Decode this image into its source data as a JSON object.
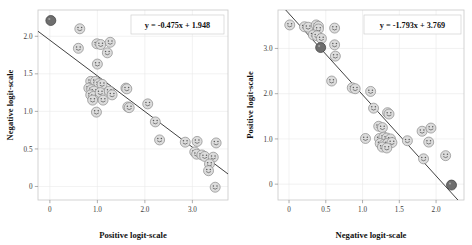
{
  "figure": {
    "background": "#ffffff",
    "panel_count": 2
  },
  "chart_data": [
    {
      "type": "scatter",
      "panel": "left",
      "title": "",
      "xlabel": "Positive logit-scale",
      "ylabel": "Negative logit-scale",
      "annotation": "y = -0.475x + 1.948",
      "fit": {
        "slope": -0.475,
        "intercept": 1.948
      },
      "xlim": [
        -0.25,
        3.75
      ],
      "ylim": [
        -0.18,
        2.35
      ],
      "xticks": [
        0,
        1.0,
        2.0,
        3.0
      ],
      "xtick_labels": [
        "0",
        "1.0",
        "2.0",
        "3.0"
      ],
      "yticks": [
        0,
        0.5,
        1.0,
        1.5,
        2.0
      ],
      "ytick_labels": [
        "0",
        "0.5",
        "1.0",
        "1.5",
        "2.0"
      ],
      "grid": true,
      "legend": "none",
      "marker": "emoji-face",
      "points": [
        {
          "x": 0.02,
          "y": 2.21,
          "dark": true
        },
        {
          "x": 0.63,
          "y": 2.1,
          "dark": false
        },
        {
          "x": 0.6,
          "y": 1.84,
          "dark": false
        },
        {
          "x": 0.99,
          "y": 1.9,
          "dark": false
        },
        {
          "x": 1.07,
          "y": 1.89,
          "dark": false
        },
        {
          "x": 1.27,
          "y": 1.92,
          "dark": false
        },
        {
          "x": 1.21,
          "y": 1.78,
          "dark": false
        },
        {
          "x": 1.0,
          "y": 1.63,
          "dark": false
        },
        {
          "x": 0.86,
          "y": 1.4,
          "dark": false
        },
        {
          "x": 0.96,
          "y": 1.4,
          "dark": false
        },
        {
          "x": 1.03,
          "y": 1.37,
          "dark": false
        },
        {
          "x": 1.1,
          "y": 1.36,
          "dark": false
        },
        {
          "x": 0.82,
          "y": 1.31,
          "dark": false
        },
        {
          "x": 0.88,
          "y": 1.29,
          "dark": false
        },
        {
          "x": 0.93,
          "y": 1.27,
          "dark": false
        },
        {
          "x": 0.86,
          "y": 1.22,
          "dark": false
        },
        {
          "x": 0.92,
          "y": 1.2,
          "dark": false
        },
        {
          "x": 1.06,
          "y": 1.25,
          "dark": false
        },
        {
          "x": 1.25,
          "y": 1.27,
          "dark": false
        },
        {
          "x": 1.31,
          "y": 1.22,
          "dark": false
        },
        {
          "x": 1.6,
          "y": 1.31,
          "dark": false
        },
        {
          "x": 1.62,
          "y": 1.3,
          "dark": false
        },
        {
          "x": 0.9,
          "y": 1.15,
          "dark": false
        },
        {
          "x": 1.12,
          "y": 1.15,
          "dark": false
        },
        {
          "x": 1.64,
          "y": 1.06,
          "dark": false
        },
        {
          "x": 2.06,
          "y": 1.1,
          "dark": false
        },
        {
          "x": 0.98,
          "y": 0.99,
          "dark": false
        },
        {
          "x": 1.67,
          "y": 1.05,
          "dark": false
        },
        {
          "x": 2.22,
          "y": 0.86,
          "dark": false
        },
        {
          "x": 2.31,
          "y": 0.62,
          "dark": false
        },
        {
          "x": 2.85,
          "y": 0.59,
          "dark": false
        },
        {
          "x": 3.1,
          "y": 0.6,
          "dark": false
        },
        {
          "x": 3.5,
          "y": 0.58,
          "dark": false
        },
        {
          "x": 3.05,
          "y": 0.46,
          "dark": false
        },
        {
          "x": 3.09,
          "y": 0.43,
          "dark": false
        },
        {
          "x": 3.2,
          "y": 0.42,
          "dark": false
        },
        {
          "x": 3.26,
          "y": 0.4,
          "dark": false
        },
        {
          "x": 3.44,
          "y": 0.39,
          "dark": false
        },
        {
          "x": 3.36,
          "y": 0.3,
          "dark": false
        },
        {
          "x": 3.34,
          "y": 0.21,
          "dark": false
        },
        {
          "x": 3.48,
          "y": -0.01,
          "dark": false
        }
      ]
    },
    {
      "type": "scatter",
      "panel": "right",
      "title": "",
      "xlabel": "Negative logit-scale",
      "ylabel": "Positive logit-scale",
      "annotation": "y = -1.793x + 3.769",
      "fit": {
        "slope": -1.793,
        "intercept": 3.769
      },
      "xlim": [
        -0.15,
        2.38
      ],
      "ylim": [
        -0.35,
        3.85
      ],
      "xticks": [
        0,
        0.5,
        1.0,
        1.5,
        2.0
      ],
      "xtick_labels": [
        "0",
        "0.5",
        "1.0",
        "1.5",
        "2.0"
      ],
      "yticks": [
        0,
        1.0,
        2.0,
        3.0
      ],
      "ytick_labels": [
        "0",
        "1.0",
        "2.0",
        "3.0"
      ],
      "grid": true,
      "legend": "none",
      "marker": "emoji-face",
      "points": [
        {
          "x": 0.01,
          "y": 3.52,
          "dark": false
        },
        {
          "x": 0.21,
          "y": 3.48,
          "dark": false
        },
        {
          "x": 0.26,
          "y": 3.47,
          "dark": false
        },
        {
          "x": 0.37,
          "y": 3.52,
          "dark": false
        },
        {
          "x": 0.4,
          "y": 3.49,
          "dark": false
        },
        {
          "x": 0.4,
          "y": 3.43,
          "dark": false
        },
        {
          "x": 0.62,
          "y": 3.45,
          "dark": false
        },
        {
          "x": 0.33,
          "y": 3.3,
          "dark": false
        },
        {
          "x": 0.38,
          "y": 3.28,
          "dark": false
        },
        {
          "x": 0.44,
          "y": 3.22,
          "dark": false
        },
        {
          "x": 0.43,
          "y": 3.02,
          "dark": true
        },
        {
          "x": 0.62,
          "y": 3.08,
          "dark": false
        },
        {
          "x": 0.63,
          "y": 2.83,
          "dark": false
        },
        {
          "x": 0.58,
          "y": 2.28,
          "dark": false
        },
        {
          "x": 0.86,
          "y": 2.13,
          "dark": false
        },
        {
          "x": 0.9,
          "y": 2.11,
          "dark": false
        },
        {
          "x": 1.11,
          "y": 2.05,
          "dark": false
        },
        {
          "x": 1.15,
          "y": 1.68,
          "dark": false
        },
        {
          "x": 1.34,
          "y": 1.58,
          "dark": false
        },
        {
          "x": 1.36,
          "y": 1.55,
          "dark": false
        },
        {
          "x": 1.22,
          "y": 1.28,
          "dark": false
        },
        {
          "x": 1.27,
          "y": 1.25,
          "dark": false
        },
        {
          "x": 1.81,
          "y": 1.17,
          "dark": false
        },
        {
          "x": 1.93,
          "y": 1.24,
          "dark": false
        },
        {
          "x": 1.04,
          "y": 1.01,
          "dark": false
        },
        {
          "x": 1.23,
          "y": 1.01,
          "dark": false
        },
        {
          "x": 1.29,
          "y": 1.04,
          "dark": false
        },
        {
          "x": 1.33,
          "y": 1.02,
          "dark": false
        },
        {
          "x": 1.38,
          "y": 1.0,
          "dark": false
        },
        {
          "x": 1.61,
          "y": 0.96,
          "dark": false
        },
        {
          "x": 1.24,
          "y": 0.9,
          "dark": false
        },
        {
          "x": 1.29,
          "y": 0.88,
          "dark": false
        },
        {
          "x": 1.34,
          "y": 0.9,
          "dark": false
        },
        {
          "x": 1.4,
          "y": 0.92,
          "dark": false
        },
        {
          "x": 1.27,
          "y": 0.82,
          "dark": false
        },
        {
          "x": 1.33,
          "y": 0.8,
          "dark": false
        },
        {
          "x": 1.9,
          "y": 0.93,
          "dark": false
        },
        {
          "x": 1.83,
          "y": 0.56,
          "dark": false
        },
        {
          "x": 2.13,
          "y": 0.63,
          "dark": false
        },
        {
          "x": 2.21,
          "y": -0.02,
          "dark": true
        }
      ]
    }
  ]
}
